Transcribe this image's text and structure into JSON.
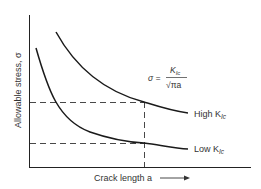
{
  "diagram": {
    "y_axis_label": "Allowable stress, σ",
    "x_axis_label": "Crack length a",
    "equation": {
      "lhs": "σ =",
      "numerator": "K",
      "numerator_sub": "Ic",
      "denominator": "√πa"
    },
    "curves": [
      {
        "name": "High",
        "label": "High K",
        "sub": "Ic"
      },
      {
        "name": "Low",
        "label": "Low K",
        "sub": "Ic"
      }
    ],
    "colors": {
      "line": "#1a1a1a",
      "text": "#333333",
      "background": "#ffffff"
    }
  }
}
